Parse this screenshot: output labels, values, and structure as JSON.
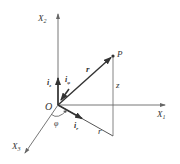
{
  "diagram": {
    "colors": {
      "line": "#555555",
      "axis": "#777777",
      "vector": "#333333",
      "text": "#333333",
      "background": "#ffffff"
    },
    "axes": [
      {
        "id": "x2",
        "label": "X",
        "subscript": "2",
        "direction": "up"
      },
      {
        "id": "x1",
        "label": "X",
        "subscript": "1",
        "direction": "right"
      },
      {
        "id": "x3",
        "label": "X",
        "subscript": "3",
        "direction": "down-left"
      }
    ],
    "origin": {
      "label": "O"
    },
    "point": {
      "label": "P"
    },
    "position_vector": {
      "label": "r"
    },
    "height": {
      "label": "z"
    },
    "radial_projection": {
      "label": "r"
    },
    "angle": {
      "label": "φ"
    },
    "unit_vectors": [
      {
        "id": "iz",
        "label": "i",
        "subscript": "z"
      },
      {
        "id": "iphi",
        "label": "i",
        "subscript": "φ"
      },
      {
        "id": "ir",
        "label": "i",
        "subscript": "r"
      }
    ]
  }
}
